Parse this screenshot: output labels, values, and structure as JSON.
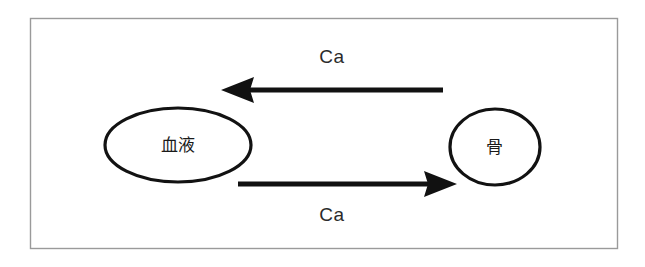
{
  "diagram": {
    "background_color": "#ffffff",
    "frame": {
      "name": "outer-frame",
      "border_color": "#9a9a9a",
      "fill_color": "#ffffff"
    },
    "nodes": [
      {
        "id": "blood",
        "label": "血液",
        "shape": "ellipse",
        "stroke_color": "#121212",
        "fill_color": "#ffffff"
      },
      {
        "id": "bone",
        "label": "骨",
        "shape": "ellipse",
        "stroke_color": "#121212",
        "fill_color": "#ffffff"
      }
    ],
    "flows": [
      {
        "id": "bone-to-blood",
        "label": "Ca",
        "direction": "left",
        "from": "bone",
        "to": "blood",
        "color": "#111111",
        "label_position": "above"
      },
      {
        "id": "blood-to-bone",
        "label": "Ca",
        "direction": "right",
        "from": "blood",
        "to": "bone",
        "color": "#111111",
        "label_position": "below"
      }
    ]
  }
}
